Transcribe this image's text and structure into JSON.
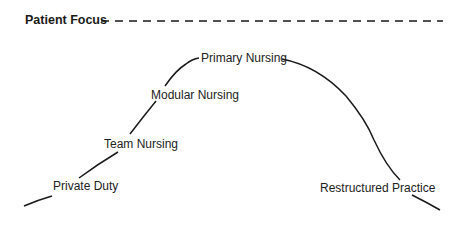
{
  "diagram": {
    "title": "Patient Focus",
    "reference_line": "dashed",
    "stages": [
      {
        "label": "Private Duty"
      },
      {
        "label": "Team Nursing"
      },
      {
        "label": "Modular Nursing"
      },
      {
        "label": "Primary Nursing"
      },
      {
        "label": "Restructured Practice"
      }
    ],
    "colors": {
      "line": "#1a1a1a",
      "text": "#222222",
      "background": "#ffffff"
    }
  }
}
